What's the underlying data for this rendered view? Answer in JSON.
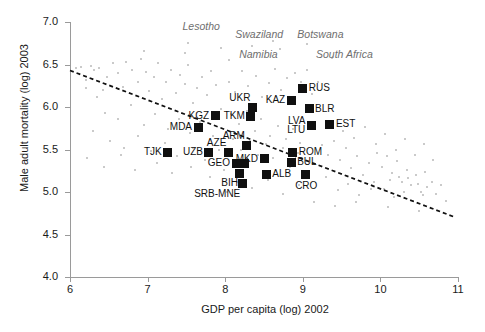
{
  "chart_data": {
    "type": "scatter",
    "title": "",
    "xlabel": "GDP per capita (log) 2002",
    "ylabel": "Male adult mortality (log) 2003",
    "xlim": [
      6,
      11
    ],
    "ylim": [
      4.0,
      7.0
    ],
    "xticks": [
      "6",
      "7",
      "8",
      "9",
      "10",
      "11"
    ],
    "yticks": [
      "4.0",
      "4.5",
      "5.0",
      "5.5",
      "6.0",
      "6.5",
      "7.0"
    ],
    "grid": false,
    "legend": "none",
    "trend_line": {
      "style": "dashed",
      "color": "#111111",
      "x_start": 6.0,
      "y_start": 6.43,
      "x_end": 10.97,
      "y_end": 4.7
    },
    "highlighted_series": {
      "name": "Transition countries",
      "marker": "filled-square",
      "color": "#101010",
      "points": [
        {
          "label": "TJK",
          "x": 7.26,
          "y": 5.47,
          "label_pos": "left"
        },
        {
          "label": "KGZ",
          "x": 7.87,
          "y": 5.9,
          "label_pos": "left"
        },
        {
          "label": "MDA",
          "x": 7.65,
          "y": 5.76,
          "label_pos": "left"
        },
        {
          "label": "UZB",
          "x": 7.79,
          "y": 5.47,
          "label_pos": "left"
        },
        {
          "label": "UKR",
          "x": 8.35,
          "y": 6.0,
          "label_pos": "above-left"
        },
        {
          "label": "TKM",
          "x": 8.33,
          "y": 5.89,
          "label_pos": "left"
        },
        {
          "label": "ARM",
          "x": 8.28,
          "y": 5.55,
          "label_pos": "above-left"
        },
        {
          "label": "AZE",
          "x": 8.04,
          "y": 5.47,
          "label_pos": "above-left"
        },
        {
          "label": "GEO",
          "x": 8.14,
          "y": 5.34,
          "label_pos": "left"
        },
        {
          "label": "GEO2",
          "x": 8.25,
          "y": 5.33,
          "label_pos": "none"
        },
        {
          "label": "BIH",
          "x": 8.19,
          "y": 5.22,
          "label_pos": "below-left"
        },
        {
          "label": "SRB-MNE",
          "x": 8.22,
          "y": 5.1,
          "label_pos": "below-left"
        },
        {
          "label": "MKD",
          "x": 8.5,
          "y": 5.39,
          "label_pos": "left"
        },
        {
          "label": "ALB",
          "x": 8.53,
          "y": 5.21,
          "label_pos": "right"
        },
        {
          "label": "KAZ",
          "x": 8.85,
          "y": 6.08,
          "label_pos": "left"
        },
        {
          "label": "RUS",
          "x": 9.0,
          "y": 6.22,
          "label_pos": "right"
        },
        {
          "label": "BLR",
          "x": 9.08,
          "y": 5.98,
          "label_pos": "right"
        },
        {
          "label": "LVA",
          "x": 9.11,
          "y": 5.78,
          "label_pos": "left-upper"
        },
        {
          "label": "LTU",
          "x": 9.11,
          "y": 5.78,
          "label_pos": "left-lower"
        },
        {
          "label": "EST",
          "x": 9.35,
          "y": 5.8,
          "label_pos": "right"
        },
        {
          "label": "ROM",
          "x": 8.87,
          "y": 5.47,
          "label_pos": "right"
        },
        {
          "label": "BUL",
          "x": 8.85,
          "y": 5.35,
          "label_pos": "right"
        },
        {
          "label": "CRO",
          "x": 9.03,
          "y": 5.21,
          "label_pos": "below"
        }
      ]
    },
    "annotated_outliers": [
      {
        "label": "Lesotho",
        "x": 7.45,
        "y": 6.95
      },
      {
        "label": "Swaziland",
        "x": 8.13,
        "y": 6.86
      },
      {
        "label": "Botswana",
        "x": 8.93,
        "y": 6.86
      },
      {
        "label": "Namibia",
        "x": 8.18,
        "y": 6.62
      },
      {
        "label": "South Africa",
        "x": 9.17,
        "y": 6.62
      }
    ],
    "background_series": {
      "name": "All other countries",
      "marker": "small-dot",
      "color": "#b9b9b9",
      "points": [
        [
          6.08,
          6.46
        ],
        [
          6.14,
          6.47
        ],
        [
          6.2,
          6.32
        ],
        [
          6.27,
          6.48
        ],
        [
          6.31,
          6.44
        ],
        [
          6.38,
          6.46
        ],
        [
          6.42,
          6.2
        ],
        [
          6.2,
          6.22
        ],
        [
          6.35,
          6.12
        ],
        [
          6.48,
          6.35
        ],
        [
          6.55,
          6.52
        ],
        [
          6.62,
          6.4
        ],
        [
          6.68,
          6.24
        ],
        [
          6.72,
          6.53
        ],
        [
          6.8,
          6.44
        ],
        [
          6.88,
          6.3
        ],
        [
          6.92,
          6.57
        ],
        [
          6.98,
          6.41
        ],
        [
          7.02,
          6.19
        ],
        [
          7.08,
          6.35
        ],
        [
          7.14,
          6.52
        ],
        [
          7.18,
          6.09
        ],
        [
          7.24,
          6.29
        ],
        [
          7.3,
          6.43
        ],
        [
          7.36,
          6.16
        ],
        [
          7.42,
          6.38
        ],
        [
          7.48,
          6.27
        ],
        [
          7.52,
          6.5
        ],
        [
          7.58,
          6.05
        ],
        [
          7.64,
          6.22
        ],
        [
          7.7,
          6.35
        ],
        [
          7.76,
          6.14
        ],
        [
          7.82,
          6.42
        ],
        [
          7.88,
          6.26
        ],
        [
          7.94,
          5.98
        ],
        [
          6.45,
          5.93
        ],
        [
          6.62,
          5.86
        ],
        [
          6.78,
          6.02
        ],
        [
          6.95,
          5.79
        ],
        [
          7.1,
          5.92
        ],
        [
          7.26,
          5.74
        ],
        [
          7.4,
          5.86
        ],
        [
          7.55,
          5.7
        ],
        [
          7.68,
          5.82
        ],
        [
          7.84,
          5.66
        ],
        [
          6.3,
          5.72
        ],
        [
          6.52,
          5.6
        ],
        [
          6.7,
          5.52
        ],
        [
          6.88,
          5.66
        ],
        [
          7.05,
          5.48
        ],
        [
          7.22,
          5.58
        ],
        [
          7.38,
          5.42
        ],
        [
          7.58,
          5.52
        ],
        [
          7.74,
          5.38
        ],
        [
          7.92,
          5.5
        ],
        [
          8.05,
          6.3
        ],
        [
          8.12,
          6.18
        ],
        [
          8.22,
          6.42
        ],
        [
          8.3,
          6.25
        ],
        [
          8.4,
          6.36
        ],
        [
          8.48,
          6.12
        ],
        [
          8.56,
          6.28
        ],
        [
          8.64,
          6.45
        ],
        [
          8.72,
          6.2
        ],
        [
          8.8,
          6.34
        ],
        [
          8.9,
          6.4
        ],
        [
          8.98,
          6.3
        ],
        [
          9.05,
          6.44
        ],
        [
          9.12,
          6.15
        ],
        [
          9.2,
          6.3
        ],
        [
          8.08,
          5.92
        ],
        [
          8.18,
          5.8
        ],
        [
          8.28,
          5.95
        ],
        [
          8.38,
          5.72
        ],
        [
          8.46,
          5.86
        ],
        [
          8.58,
          5.66
        ],
        [
          8.68,
          5.78
        ],
        [
          8.78,
          5.62
        ],
        [
          8.88,
          5.74
        ],
        [
          8.96,
          5.58
        ],
        [
          8.1,
          5.62
        ],
        [
          8.2,
          5.5
        ],
        [
          8.32,
          5.6
        ],
        [
          8.42,
          5.44
        ],
        [
          8.52,
          5.56
        ],
        [
          8.62,
          5.4
        ],
        [
          8.74,
          5.52
        ],
        [
          8.84,
          5.3
        ],
        [
          8.94,
          5.46
        ],
        [
          9.04,
          5.36
        ],
        [
          8.15,
          5.12
        ],
        [
          8.35,
          5.05
        ],
        [
          8.55,
          5.14
        ],
        [
          8.75,
          4.98
        ],
        [
          8.95,
          5.08
        ],
        [
          9.25,
          5.55
        ],
        [
          9.32,
          5.44
        ],
        [
          9.4,
          5.6
        ],
        [
          9.48,
          5.38
        ],
        [
          9.56,
          5.52
        ],
        [
          9.62,
          5.28
        ],
        [
          9.7,
          5.42
        ],
        [
          9.78,
          5.2
        ],
        [
          9.85,
          5.34
        ],
        [
          9.92,
          5.12
        ],
        [
          9.3,
          5.18
        ],
        [
          9.45,
          5.02
        ],
        [
          9.58,
          5.1
        ],
        [
          9.72,
          4.96
        ],
        [
          9.88,
          5.04
        ],
        [
          9.95,
          5.46
        ],
        [
          10.02,
          5.3
        ],
        [
          10.08,
          5.42
        ],
        [
          10.15,
          5.22
        ],
        [
          10.22,
          5.36
        ],
        [
          10.28,
          5.12
        ],
        [
          10.34,
          5.26
        ],
        [
          10.4,
          5.08
        ],
        [
          10.46,
          5.2
        ],
        [
          10.52,
          5.0
        ],
        [
          10.05,
          5.04
        ],
        [
          10.18,
          4.94
        ],
        [
          10.3,
          5.0
        ],
        [
          10.42,
          4.9
        ],
        [
          10.55,
          4.96
        ],
        [
          10.12,
          5.14
        ],
        [
          10.24,
          5.18
        ],
        [
          10.36,
          5.16
        ],
        [
          10.48,
          5.1
        ],
        [
          10.6,
          5.06
        ],
        [
          10.58,
          5.24
        ],
        [
          10.66,
          5.12
        ],
        [
          10.72,
          4.98
        ],
        [
          10.78,
          5.08
        ],
        [
          10.84,
          4.9
        ],
        [
          9.15,
          4.88
        ],
        [
          9.42,
          4.84
        ],
        [
          9.68,
          4.88
        ],
        [
          10.1,
          4.82
        ],
        [
          10.5,
          4.78
        ],
        [
          7.95,
          6.7
        ],
        [
          8.35,
          6.72
        ],
        [
          8.62,
          6.78
        ],
        [
          8.7,
          6.68
        ],
        [
          9.05,
          6.74
        ],
        [
          7.52,
          6.75
        ],
        [
          7.48,
          6.64
        ],
        [
          6.95,
          6.66
        ],
        [
          9.38,
          6.58
        ],
        [
          8.05,
          6.55
        ],
        [
          6.22,
          5.4
        ],
        [
          6.44,
          5.3
        ],
        [
          6.66,
          5.44
        ],
        [
          6.84,
          5.26
        ],
        [
          7.12,
          5.34
        ],
        [
          7.32,
          5.22
        ],
        [
          7.56,
          5.3
        ],
        [
          7.8,
          5.18
        ],
        [
          7.98,
          5.26
        ],
        [
          8.02,
          5.0
        ],
        [
          9.52,
          5.72
        ],
        [
          9.66,
          5.64
        ],
        [
          9.8,
          5.76
        ],
        [
          9.94,
          5.56
        ],
        [
          10.06,
          5.68
        ],
        [
          10.2,
          5.5
        ],
        [
          10.32,
          5.62
        ],
        [
          10.44,
          5.44
        ],
        [
          10.56,
          5.56
        ],
        [
          10.68,
          5.38
        ]
      ]
    }
  }
}
